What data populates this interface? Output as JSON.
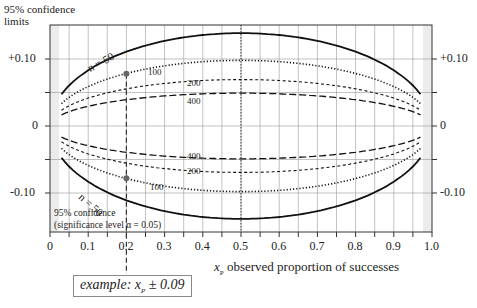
{
  "chart_data": {
    "type": "line",
    "title": "95% confidence limits",
    "ylabel_line1": "95% confidence",
    "ylabel_line2": "limits",
    "xlabel_symbol": "x",
    "xlabel_sub": "P",
    "xlabel_text": "observed proportion of successes",
    "xlim": [
      0,
      1.0
    ],
    "ylim": [
      -0.15,
      0.15
    ],
    "x_ticks": [
      "0",
      "0.1",
      "0.2",
      "0.3",
      "0.4",
      "0.5",
      "0.6",
      "0.7",
      "0.8",
      "0.9",
      "1.0"
    ],
    "y_ticks_left": [
      "+0.10",
      "0",
      "-0.10"
    ],
    "y_ticks_right": [
      "+0.10",
      "0",
      "-0.10"
    ],
    "grid": true,
    "formula": "±1.96·sqrt(p(1-p)/n)",
    "x": [
      0.03,
      0.05,
      0.1,
      0.15,
      0.2,
      0.3,
      0.4,
      0.5,
      0.6,
      0.7,
      0.8,
      0.85,
      0.9,
      0.95,
      0.97
    ],
    "series": [
      {
        "name": "n = 50",
        "label": "n = 50",
        "style": "solid",
        "upper": [
          0.047,
          0.06,
          0.083,
          0.099,
          0.111,
          0.127,
          0.136,
          0.139,
          0.136,
          0.127,
          0.111,
          0.099,
          0.083,
          0.06,
          0.047
        ]
      },
      {
        "name": "n = 100",
        "label": "100",
        "style": "dotted",
        "upper": [
          0.033,
          0.043,
          0.059,
          0.07,
          0.078,
          0.09,
          0.096,
          0.098,
          0.096,
          0.09,
          0.078,
          0.07,
          0.059,
          0.043,
          0.033
        ]
      },
      {
        "name": "n = 200",
        "label": "200",
        "style": "short-dash",
        "upper": [
          0.024,
          0.03,
          0.042,
          0.049,
          0.055,
          0.064,
          0.068,
          0.069,
          0.068,
          0.064,
          0.055,
          0.049,
          0.042,
          0.03,
          0.024
        ]
      },
      {
        "name": "n = 400",
        "label": "400",
        "style": "long-dash",
        "upper": [
          0.017,
          0.021,
          0.029,
          0.035,
          0.039,
          0.045,
          0.048,
          0.049,
          0.048,
          0.045,
          0.039,
          0.035,
          0.029,
          0.021,
          0.017
        ]
      }
    ],
    "annotations": {
      "example_point_x": 0.2,
      "example_point_y": 0.078,
      "center_line_x": 0.5,
      "significance_line1": "95% confidence",
      "significance_line2": "(significance level α = 0.05)",
      "example_prefix": "example:",
      "example_var": "x",
      "example_sub": "P",
      "example_value": "± 0.09"
    },
    "legend_position": "inline"
  },
  "caption": "Fig. 2 The 95% confidence limits for the proportion of successes, x_P, plotted against the observed proportion for various sample sizes n"
}
